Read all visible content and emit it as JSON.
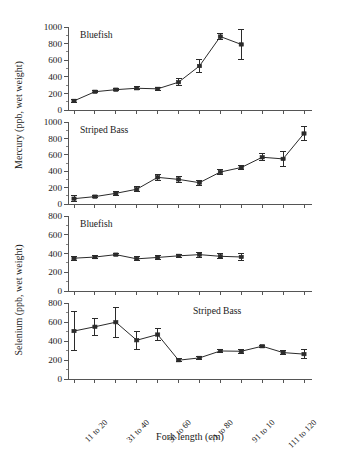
{
  "figure": {
    "xlabel": "Fork length (cm)",
    "ylabel_mercury": "Mercury (ppb, wet weight)",
    "ylabel_selenium": "Selenium (ppb, wet weight)"
  },
  "x_ticks": {
    "count": 12,
    "labeled_indices": [
      0,
      2,
      4,
      6,
      8,
      10
    ],
    "labels": [
      "11 to 20",
      "31 to 40",
      "51 to 60",
      "71 to 80",
      "91 to 10",
      "111 to 120"
    ],
    "all_categories": [
      "11 to 20",
      "21 to 30",
      "31 to 40",
      "41 to 50",
      "51 to 60",
      "61 to 70",
      "71 to 80",
      "81 to 90",
      "91 to 10",
      "101 to 110",
      "111 to 120",
      "121 to 130"
    ]
  },
  "chart_data": [
    {
      "type": "line",
      "title": "Bluefish",
      "panel": 1,
      "xlabel": "Fork length (cm)",
      "ylabel": "Mercury (ppb, wet weight)",
      "ylim": [
        0,
        1000
      ],
      "yticks": [
        0,
        200,
        400,
        600,
        800,
        1000
      ],
      "grid": false,
      "categories": [
        "11 to 20",
        "21 to 30",
        "31 to 40",
        "41 to 50",
        "51 to 60",
        "61 to 70",
        "71 to 80",
        "81 to 90",
        "91 to 10"
      ],
      "values": [
        110,
        220,
        245,
        262,
        255,
        335,
        530,
        885,
        790
      ],
      "err_low": [
        18,
        14,
        12,
        20,
        18,
        45,
        80,
        40,
        185
      ],
      "err_high": [
        18,
        14,
        12,
        20,
        18,
        45,
        80,
        40,
        185
      ]
    },
    {
      "type": "line",
      "title": "Striped Bass",
      "panel": 2,
      "xlabel": "Fork length (cm)",
      "ylabel": "Mercury (ppb, wet weight)",
      "ylim": [
        0,
        1000
      ],
      "yticks": [
        0,
        200,
        400,
        600,
        800,
        1000
      ],
      "grid": false,
      "categories": [
        "11 to 20",
        "21 to 30",
        "31 to 40",
        "41 to 50",
        "51 to 60",
        "61 to 70",
        "71 to 80",
        "81 to 90",
        "91 to 10",
        "101 to 110",
        "111 to 120",
        "121 to 130"
      ],
      "values": [
        65,
        90,
        130,
        180,
        325,
        300,
        260,
        390,
        445,
        570,
        550,
        860
      ],
      "err_low": [
        35,
        12,
        28,
        32,
        40,
        32,
        30,
        30,
        28,
        42,
        90,
        85
      ],
      "err_high": [
        35,
        12,
        28,
        32,
        40,
        32,
        30,
        30,
        28,
        42,
        90,
        85
      ]
    },
    {
      "type": "line",
      "title": "Bluefish",
      "panel": 3,
      "xlabel": "Fork length (cm)",
      "ylabel": "Selenium (ppb, wet weight)",
      "ylim": [
        0,
        800
      ],
      "yticks": [
        0,
        200,
        400,
        600,
        800
      ],
      "grid": false,
      "categories": [
        "11 to 20",
        "21 to 30",
        "31 to 40",
        "41 to 50",
        "51 to 60",
        "61 to 70",
        "71 to 80",
        "81 to 90",
        "91 to 10"
      ],
      "values": [
        350,
        362,
        388,
        343,
        358,
        375,
        388,
        370,
        363
      ],
      "err_low": [
        22,
        18,
        14,
        20,
        18,
        18,
        28,
        25,
        42
      ],
      "err_high": [
        22,
        18,
        14,
        20,
        18,
        18,
        28,
        25,
        42
      ]
    },
    {
      "type": "line",
      "title": "Striped Bass",
      "panel": 4,
      "xlabel": "Fork length (cm)",
      "ylabel": "Selenium (ppb, wet weight)",
      "ylim": [
        0,
        800
      ],
      "yticks": [
        0,
        200,
        400,
        600,
        800
      ],
      "grid": false,
      "categories": [
        "11 to 20",
        "21 to 30",
        "31 to 40",
        "41 to 50",
        "51 to 60",
        "61 to 70",
        "71 to 80",
        "81 to 90",
        "91 to 10",
        "101 to 110",
        "111 to 120",
        "121 to 130"
      ],
      "values": [
        505,
        550,
        598,
        408,
        468,
        198,
        222,
        295,
        292,
        345,
        278,
        262
      ],
      "err_low": [
        205,
        90,
        158,
        95,
        62,
        14,
        18,
        14,
        22,
        12,
        22,
        45
      ],
      "err_high": [
        205,
        90,
        158,
        95,
        62,
        14,
        18,
        14,
        22,
        12,
        22,
        45
      ]
    }
  ]
}
